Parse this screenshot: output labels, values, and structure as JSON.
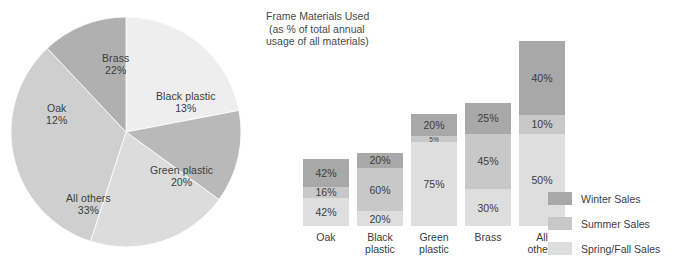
{
  "chart_data": [
    {
      "type": "pie",
      "title": "",
      "categories": [
        "Brass",
        "Black plastic",
        "Green plastic",
        "All others",
        "Oak"
      ],
      "values": [
        22,
        13,
        20,
        33,
        12
      ],
      "value_suffix": "%",
      "slices": [
        {
          "label": "Brass",
          "value": 22,
          "value_text": "22%",
          "color": "#eeeeee",
          "label_x": 92,
          "label_y": 36
        },
        {
          "label": "Black plastic",
          "value": 13,
          "value_text": "13%",
          "color": "#b9b9b9",
          "label_x": 146,
          "label_y": 74
        },
        {
          "label": "Green plastic",
          "value": 20,
          "value_text": "20%",
          "color": "#dcdcdc",
          "label_x": 140,
          "label_y": 148
        },
        {
          "label": "All others",
          "value": 33,
          "value_text": "33%",
          "color": "#cfcfcf",
          "label_x": 56,
          "label_y": 176
        },
        {
          "label": "Oak",
          "value": 12,
          "value_text": "12%",
          "color": "#b0b0b0",
          "label_x": 36,
          "label_y": 86
        }
      ],
      "legend_position": "none",
      "grid": false
    },
    {
      "type": "bar",
      "subtype": "stacked",
      "title": "Frame Materials Used\n (as % of total annual\nusage of all materials)",
      "categories": [
        "Oak",
        "Black\nplastic",
        "Green\nplastic",
        "Brass",
        "All\nothers"
      ],
      "category_totals": [
        12,
        13,
        20,
        22,
        33
      ],
      "series": [
        {
          "name": "Winter Sales",
          "color": "#a8a8a8",
          "values": [
            42,
            20,
            20,
            25,
            40
          ]
        },
        {
          "name": "Summer Sales",
          "color": "#c8c8c8",
          "values": [
            16,
            60,
            5,
            45,
            10
          ]
        },
        {
          "name": "Spring/Fall Sales",
          "color": "#dedede",
          "values": [
            42,
            20,
            75,
            30,
            50
          ]
        }
      ],
      "bars": [
        {
          "category": "Oak",
          "label": "Oak",
          "total": 12,
          "x": 41,
          "segments": [
            {
              "series": "Winter Sales",
              "value": 42,
              "value_text": "42%",
              "color": "#a8a8a8"
            },
            {
              "series": "Summer Sales",
              "value": 16,
              "value_text": "16%",
              "color": "#c8c8c8"
            },
            {
              "series": "Spring/Fall Sales",
              "value": 42,
              "value_text": "42%",
              "color": "#dedede"
            }
          ]
        },
        {
          "category": "Black plastic",
          "label": "Black\nplastic",
          "total": 13,
          "x": 95,
          "segments": [
            {
              "series": "Winter Sales",
              "value": 20,
              "value_text": "20%",
              "color": "#a8a8a8"
            },
            {
              "series": "Summer Sales",
              "value": 60,
              "value_text": "60%",
              "color": "#c8c8c8"
            },
            {
              "series": "Spring/Fall Sales",
              "value": 20,
              "value_text": "20%",
              "color": "#dedede"
            }
          ]
        },
        {
          "category": "Green plastic",
          "label": "Green\nplastic",
          "total": 20,
          "x": 149,
          "segments": [
            {
              "series": "Winter Sales",
              "value": 20,
              "value_text": "20%",
              "color": "#a8a8a8"
            },
            {
              "series": "Summer Sales",
              "value": 5,
              "value_text": "5%",
              "color": "#c8c8c8"
            },
            {
              "series": "Spring/Fall Sales",
              "value": 75,
              "value_text": "75%",
              "color": "#dedede"
            }
          ]
        },
        {
          "category": "Brass",
          "label": "Brass",
          "total": 22,
          "x": 203,
          "segments": [
            {
              "series": "Winter Sales",
              "value": 25,
              "value_text": "25%",
              "color": "#a8a8a8"
            },
            {
              "series": "Summer Sales",
              "value": 45,
              "value_text": "45%",
              "color": "#c8c8c8"
            },
            {
              "series": "Spring/Fall Sales",
              "value": 30,
              "value_text": "30%",
              "color": "#dedede"
            }
          ]
        },
        {
          "category": "All others",
          "label": "All\nothers",
          "total": 33,
          "x": 257,
          "segments": [
            {
              "series": "Winter Sales",
              "value": 40,
              "value_text": "40%",
              "color": "#a8a8a8"
            },
            {
              "series": "Summer Sales",
              "value": 10,
              "value_text": "10%",
              "color": "#c8c8c8"
            },
            {
              "series": "Spring/Fall Sales",
              "value": 50,
              "value_text": "50%",
              "color": "#dedede"
            }
          ]
        }
      ],
      "xlabel": "",
      "ylabel": "",
      "ylim": [
        0,
        100
      ],
      "grid": false,
      "legend_position": "right"
    }
  ],
  "pie": {
    "labels": [
      {
        "name": "Brass",
        "pct": "22%"
      },
      {
        "name": "Black plastic",
        "pct": "13%"
      },
      {
        "name": "Green plastic",
        "pct": "20%"
      },
      {
        "name": "All others",
        "pct": "33%"
      },
      {
        "name": "Oak",
        "pct": "12%"
      }
    ]
  },
  "bar": {
    "title_line1": "Frame Materials Used",
    "title_line2": " (as % of total annual",
    "title_line3": "usage of all materials)"
  },
  "legend": {
    "items": [
      {
        "label": "Winter Sales",
        "color": "#a8a8a8"
      },
      {
        "label": "Summer Sales",
        "color": "#c8c8c8"
      },
      {
        "label": "Spring/Fall Sales",
        "color": "#dedede"
      }
    ]
  },
  "colors": {
    "winter": "#a8a8a8",
    "summer": "#c8c8c8",
    "spring_fall": "#dedede",
    "text": "#3c3c3c",
    "background": "#ffffff"
  }
}
